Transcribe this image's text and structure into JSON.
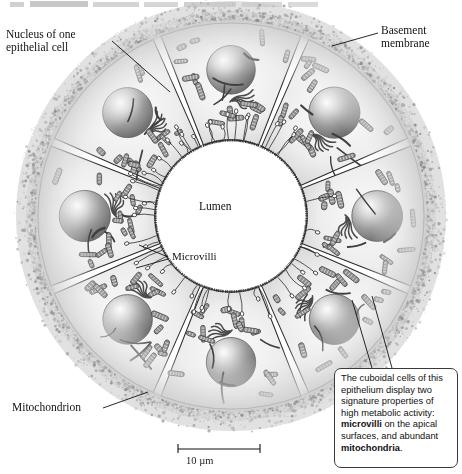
{
  "figure": {
    "title_fragment": "",
    "cell_count": 8
  },
  "labels": {
    "nucleus": "Nucleus of one\nepithelial cell",
    "basement_membrane": "Basement\nmembrane",
    "microvilli": "Microvilli",
    "lumen": "Lumen",
    "mitochondrion": "Mitochondrion"
  },
  "callout": {
    "line1": "The cuboidal cells of this",
    "line2": "epithelium display two",
    "line3": "signature properties of",
    "line4": "high metabolic activity:",
    "bold1": "microvilli",
    "line5": " on the apical",
    "line6": "surfaces, and abundant",
    "bold2": "mitochondria",
    "line7": "."
  },
  "scale_bar": {
    "label": "10 µm",
    "length_px": 82
  },
  "colors": {
    "ink": "#1a1a1a",
    "cytoplasm_light": "#f2f2f2",
    "cytoplasm_mid": "#d8d8d8",
    "nucleus_dark": "#7c7c7c",
    "nucleus_light": "#e6e6e6",
    "mitochondrion": "#8b8b8b",
    "basement_membrane": "#b9b9b9",
    "lumen": "#ffffff",
    "callout_border": "#3a3a3a"
  }
}
